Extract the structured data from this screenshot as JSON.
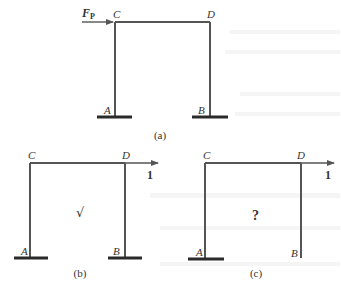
{
  "figure": {
    "panels": [
      {
        "id": "a",
        "caption": "(a)",
        "nodes": {
          "C": "C",
          "D": "D",
          "A": "A",
          "B": "B"
        },
        "load": {
          "label": "F",
          "subscript": "P",
          "direction": "right",
          "applied_at": "C"
        },
        "supports": {
          "A": "fixed",
          "B": "fixed"
        }
      },
      {
        "id": "b",
        "caption": "(b)",
        "nodes": {
          "C": "C",
          "D": "D",
          "A": "A",
          "B": "B"
        },
        "load": {
          "label": "1",
          "direction": "right",
          "applied_at": "D"
        },
        "supports": {
          "A": "fixed",
          "B": "fixed"
        },
        "annotation": "√"
      },
      {
        "id": "c",
        "caption": "(c)",
        "nodes": {
          "C": "C",
          "D": "D",
          "A": "A",
          "B": "B"
        },
        "load": {
          "label": "1",
          "direction": "right",
          "applied_at": "D"
        },
        "supports": {
          "A": "fixed",
          "B": "free"
        },
        "annotation": "?"
      }
    ],
    "colors": {
      "member": "#555555",
      "ground": "#2a2a2a",
      "text": "#333333",
      "background": "#ffffff"
    }
  }
}
